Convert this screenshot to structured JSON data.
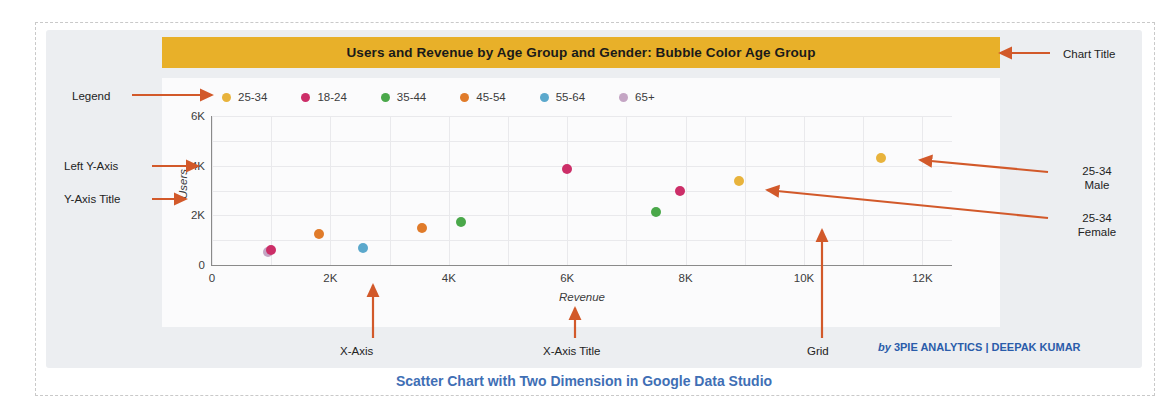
{
  "chart_title": "Users and Revenue by Age Group and Gender: Bubble Color Age  Group",
  "caption": "Scatter Chart with Two Dimension in Google Data Studio",
  "attribution": {
    "prefix": "by",
    "text": "3PIE ANALYTICS | DEEPAK KUMAR"
  },
  "annotations": {
    "legend": "Legend",
    "left_y_axis": "Left Y-Axis",
    "y_axis_title": "Y-Axis Title",
    "chart_title": "Chart Title",
    "point_male_line1": "25-34",
    "point_male_line2": "Male",
    "point_female_line1": "25-34",
    "point_female_line2": "Female",
    "x_axis": "X-Axis",
    "x_axis_title": "X-Axis Title",
    "grid": "Grid"
  },
  "colors": {
    "title_bar": "#e8b029",
    "arrow": "#d2592a",
    "caption": "#3f6fb5",
    "attribution": "#2a5caa",
    "card": "#eceef1",
    "plot": "#fbfbfc",
    "grid": "#e9e9ec",
    "axis": "#8a8a8a"
  },
  "chart_data": {
    "type": "scatter",
    "title": "Users and Revenue by Age Group and Gender: Bubble Color Age  Group",
    "xlabel": "Revenue",
    "ylabel": "Users",
    "xlim": [
      0,
      12500
    ],
    "ylim": [
      0,
      6000
    ],
    "xticks": [
      "0",
      "2K",
      "4K",
      "6K",
      "8K",
      "10K",
      "12K"
    ],
    "xtick_values": [
      0,
      2000,
      4000,
      6000,
      8000,
      10000,
      12000
    ],
    "yticks": [
      "0",
      "2K",
      "4K",
      "6K"
    ],
    "ytick_values": [
      0,
      2000,
      4000,
      6000
    ],
    "grid": true,
    "grid_interval_x": 1000,
    "grid_interval_y": 1000,
    "legend_position": "top",
    "legend": [
      {
        "label": "25-34",
        "color": "#e8b33c"
      },
      {
        "label": "18-24",
        "color": "#cc2e68"
      },
      {
        "label": "35-44",
        "color": "#4aa84a"
      },
      {
        "label": "45-54",
        "color": "#e07b2a"
      },
      {
        "label": "55-64",
        "color": "#5ba8cc"
      },
      {
        "label": "65+",
        "color": "#c4a5c4"
      }
    ],
    "points": [
      {
        "label": "65+",
        "gender": "",
        "x": 950,
        "y": 520,
        "color": "#c4a5c4"
      },
      {
        "label": "18-24",
        "gender": "",
        "x": 1000,
        "y": 600,
        "color": "#cc2e68"
      },
      {
        "label": "45-54",
        "gender": "",
        "x": 1800,
        "y": 1250,
        "color": "#e07b2a"
      },
      {
        "label": "55-64",
        "gender": "",
        "x": 2550,
        "y": 700,
        "color": "#5ba8cc"
      },
      {
        "label": "45-54",
        "gender": "",
        "x": 3550,
        "y": 1500,
        "color": "#e07b2a"
      },
      {
        "label": "35-44",
        "gender": "",
        "x": 4200,
        "y": 1750,
        "color": "#4aa84a"
      },
      {
        "label": "18-24",
        "gender": "",
        "x": 6000,
        "y": 3850,
        "color": "#cc2e68"
      },
      {
        "label": "35-44",
        "gender": "",
        "x": 7500,
        "y": 2150,
        "color": "#4aa84a"
      },
      {
        "label": "18-24",
        "gender": "",
        "x": 7900,
        "y": 3000,
        "color": "#cc2e68"
      },
      {
        "label": "25-34",
        "gender": "Female",
        "x": 8900,
        "y": 3400,
        "color": "#e8b33c"
      },
      {
        "label": "25-34",
        "gender": "Male",
        "x": 11300,
        "y": 4300,
        "color": "#e8b33c"
      }
    ]
  }
}
